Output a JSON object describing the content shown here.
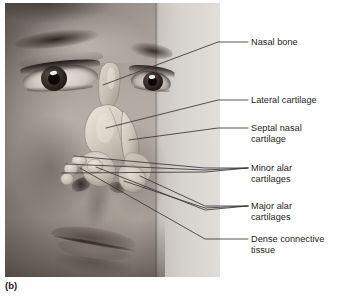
{
  "figure": {
    "caption": "(b)",
    "kind": "anatomical-photograph-with-overlay",
    "photo_description": "Grayscale three-quarter view photograph of a woman's face with the nasal skeleton illustrated over the nose"
  },
  "labels": [
    {
      "id": "nasal-bone",
      "text": "Nasal bone"
    },
    {
      "id": "lateral-cartilage",
      "text": "Lateral cartilage"
    },
    {
      "id": "septal-nasal-cartilage",
      "text": "Septal nasal\ncartilage"
    },
    {
      "id": "minor-alar-cartilages",
      "text": "Minor alar\ncartilages"
    },
    {
      "id": "major-alar-cartilages",
      "text": "Major alar\ncartilages"
    },
    {
      "id": "dense-connective-tissue",
      "text": "Dense connective\ntissue"
    }
  ],
  "colors": {
    "page_background": "#ffffff",
    "label_text": "#231f20",
    "leader_line": "#3a3538",
    "cartilage_light": "#dcd6cc",
    "cartilage_mid": "#bdb4a8",
    "cartilage_shadow": "#8e867c"
  }
}
